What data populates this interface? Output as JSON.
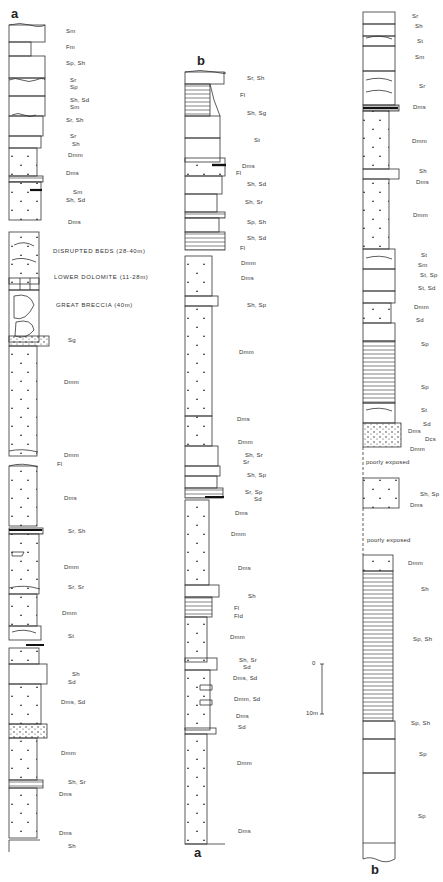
{
  "figure": {
    "type": "stratigraphic-logs",
    "scale_bar": {
      "top_label": "0",
      "bottom_label": "10m"
    }
  },
  "columns": [
    {
      "id": "col-a-left",
      "top_letter": "a",
      "bottom_letter": "",
      "labels": [
        {
          "text": "Sm",
          "x": 66,
          "y": 32
        },
        {
          "text": "Fm",
          "x": 66,
          "y": 48
        },
        {
          "text": "Sp, Sh",
          "x": 66,
          "y": 64
        },
        {
          "text": "Sr",
          "x": 70,
          "y": 81
        },
        {
          "text": "Sp",
          "x": 70,
          "y": 88
        },
        {
          "text": "Sh, Sd",
          "x": 70,
          "y": 101
        },
        {
          "text": "Sm",
          "x": 70,
          "y": 108
        },
        {
          "text": "Sr, Sh",
          "x": 66,
          "y": 121
        },
        {
          "text": "Sr",
          "x": 70,
          "y": 137
        },
        {
          "text": "Sh",
          "x": 72,
          "y": 145
        },
        {
          "text": "Dmm",
          "x": 68,
          "y": 156
        },
        {
          "text": "Dms",
          "x": 66,
          "y": 174
        },
        {
          "text": "Sm",
          "x": 73,
          "y": 193
        },
        {
          "text": "Sh, Sd",
          "x": 66,
          "y": 201
        },
        {
          "text": "Dms",
          "x": 68,
          "y": 223
        },
        {
          "text": "DISRUPTED BEDS (28-40m)",
          "x": 53,
          "y": 252,
          "big": true
        },
        {
          "text": "LOWER DOLOMITE (11-28m)",
          "x": 54,
          "y": 278,
          "big": true
        },
        {
          "text": "GREAT BRECCIA (40m)",
          "x": 56,
          "y": 306,
          "big": true
        },
        {
          "text": "Sg",
          "x": 68,
          "y": 341
        },
        {
          "text": "Dmm",
          "x": 64,
          "y": 383
        },
        {
          "text": "Dmm",
          "x": 64,
          "y": 456
        },
        {
          "text": "Fl",
          "x": 57,
          "y": 465
        },
        {
          "text": "Dms",
          "x": 64,
          "y": 499
        },
        {
          "text": "Sr, Sh",
          "x": 68,
          "y": 532
        },
        {
          "text": "Dmm",
          "x": 64,
          "y": 568
        },
        {
          "text": "Sr, Sr",
          "x": 68,
          "y": 588
        },
        {
          "text": "Dmm",
          "x": 62,
          "y": 614
        },
        {
          "text": "St",
          "x": 68,
          "y": 637
        },
        {
          "text": "Sh",
          "x": 72,
          "y": 675
        },
        {
          "text": "Sd",
          "x": 68,
          "y": 683
        },
        {
          "text": "Dms, Sd",
          "x": 61,
          "y": 703
        },
        {
          "text": "Dmm",
          "x": 61,
          "y": 754
        },
        {
          "text": "Sh, Sr",
          "x": 68,
          "y": 783
        },
        {
          "text": "Dms",
          "x": 59,
          "y": 795
        },
        {
          "text": "Dms",
          "x": 59,
          "y": 834
        },
        {
          "text": "Sh",
          "x": 68,
          "y": 847
        }
      ]
    },
    {
      "id": "col-b-middle",
      "top_letter": "b",
      "bottom_letter": "a",
      "labels": [
        {
          "text": "Sr, Sh",
          "x": 247,
          "y": 79
        },
        {
          "text": "Fl",
          "x": 240,
          "y": 96
        },
        {
          "text": "Sh, Sg",
          "x": 247,
          "y": 114
        },
        {
          "text": "St",
          "x": 254,
          "y": 141
        },
        {
          "text": "Dms",
          "x": 242,
          "y": 167
        },
        {
          "text": "Fl",
          "x": 236,
          "y": 174
        },
        {
          "text": "Sh, Sd",
          "x": 247,
          "y": 185
        },
        {
          "text": "Sh, Sr",
          "x": 245,
          "y": 203
        },
        {
          "text": "Sp, Sh",
          "x": 247,
          "y": 223
        },
        {
          "text": "Sh, Sd",
          "x": 247,
          "y": 239
        },
        {
          "text": "Fl",
          "x": 240,
          "y": 249
        },
        {
          "text": "Dmm",
          "x": 241,
          "y": 264
        },
        {
          "text": "Dms",
          "x": 241,
          "y": 279
        },
        {
          "text": "Sh, Sp",
          "x": 247,
          "y": 306
        },
        {
          "text": "Dmm",
          "x": 239,
          "y": 353
        },
        {
          "text": "Dms",
          "x": 237,
          "y": 420
        },
        {
          "text": "Dmm",
          "x": 238,
          "y": 443
        },
        {
          "text": "Sh, Sr",
          "x": 245,
          "y": 456
        },
        {
          "text": "Sr",
          "x": 243,
          "y": 463
        },
        {
          "text": "Sh, Sp",
          "x": 247,
          "y": 476
        },
        {
          "text": "Sr, Sp",
          "x": 245,
          "y": 493
        },
        {
          "text": "Sd",
          "x": 254,
          "y": 500
        },
        {
          "text": "Dms",
          "x": 235,
          "y": 514
        },
        {
          "text": "Dmm",
          "x": 231,
          "y": 535
        },
        {
          "text": "Dms",
          "x": 238,
          "y": 569
        },
        {
          "text": "Sh",
          "x": 248,
          "y": 597
        },
        {
          "text": "Fl",
          "x": 234,
          "y": 609
        },
        {
          "text": "Fld",
          "x": 234,
          "y": 617
        },
        {
          "text": "Dmm",
          "x": 230,
          "y": 638
        },
        {
          "text": "Sh, Sr",
          "x": 239,
          "y": 661
        },
        {
          "text": "Sd",
          "x": 243,
          "y": 668
        },
        {
          "text": "Dms, Sd",
          "x": 233,
          "y": 679
        },
        {
          "text": "Dmm, Sd",
          "x": 234,
          "y": 700
        },
        {
          "text": "Dms",
          "x": 236,
          "y": 717
        },
        {
          "text": "Sd",
          "x": 238,
          "y": 728
        },
        {
          "text": "Dmm",
          "x": 237,
          "y": 764
        },
        {
          "text": "Dms",
          "x": 238,
          "y": 832
        }
      ]
    },
    {
      "id": "col-b-right",
      "top_letter": "",
      "bottom_letter": "b",
      "labels": [
        {
          "text": "Sr",
          "x": 412,
          "y": 17
        },
        {
          "text": "Sh",
          "x": 415,
          "y": 27
        },
        {
          "text": "St",
          "x": 417,
          "y": 42
        },
        {
          "text": "Sm",
          "x": 415,
          "y": 58
        },
        {
          "text": "Sr",
          "x": 419,
          "y": 87
        },
        {
          "text": "Dms",
          "x": 413,
          "y": 108
        },
        {
          "text": "Dmm",
          "x": 412,
          "y": 142
        },
        {
          "text": "Sh",
          "x": 419,
          "y": 172
        },
        {
          "text": "Dms",
          "x": 416,
          "y": 183
        },
        {
          "text": "Dmm",
          "x": 413,
          "y": 216
        },
        {
          "text": "St",
          "x": 421,
          "y": 256
        },
        {
          "text": "Sm",
          "x": 418,
          "y": 266
        },
        {
          "text": "St, Sp",
          "x": 420,
          "y": 276
        },
        {
          "text": "St, Sd",
          "x": 418,
          "y": 289
        },
        {
          "text": "Dmm",
          "x": 414,
          "y": 308
        },
        {
          "text": "Sd",
          "x": 416,
          "y": 321
        },
        {
          "text": "Sp",
          "x": 421,
          "y": 345
        },
        {
          "text": "Sp",
          "x": 421,
          "y": 388
        },
        {
          "text": "St",
          "x": 421,
          "y": 411
        },
        {
          "text": "Sd",
          "x": 423,
          "y": 425
        },
        {
          "text": "Dms",
          "x": 408,
          "y": 432
        },
        {
          "text": "Dcs",
          "x": 425,
          "y": 440
        },
        {
          "text": "Dmm",
          "x": 410,
          "y": 450
        },
        {
          "text": "poorly exposed",
          "x": 366,
          "y": 463
        },
        {
          "text": "Sh, Sp",
          "x": 420,
          "y": 495
        },
        {
          "text": "Dms",
          "x": 410,
          "y": 506
        },
        {
          "text": "poorly exposed",
          "x": 367,
          "y": 541
        },
        {
          "text": "Dmm",
          "x": 408,
          "y": 564
        },
        {
          "text": "Sh",
          "x": 421,
          "y": 590
        },
        {
          "text": "Sp, Sh",
          "x": 413,
          "y": 640
        },
        {
          "text": "Sp, Sh",
          "x": 411,
          "y": 724
        },
        {
          "text": "Sp",
          "x": 419,
          "y": 755
        },
        {
          "text": "Sp",
          "x": 418,
          "y": 817
        }
      ]
    }
  ]
}
